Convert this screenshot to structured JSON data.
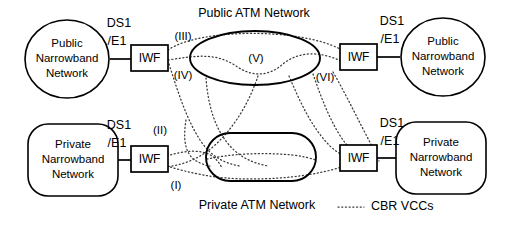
{
  "diagram": {
    "title_public_atm": "Public ATM Network",
    "title_private_atm": "Private ATM Network",
    "nodes": {
      "public_nb_left": {
        "line1": "Public",
        "line2": "Narrowband",
        "line3": "Network"
      },
      "public_nb_right": {
        "line1": "Public",
        "line2": "Narrowband",
        "line3": "Network"
      },
      "private_nb_left": {
        "line1": "Private",
        "line2": "Narrowband",
        "line3": "Network"
      },
      "private_nb_right": {
        "line1": "Private",
        "line2": "Narrowband",
        "line3": "Network"
      }
    },
    "iwf": {
      "top_left": "IWF",
      "top_right": "IWF",
      "bottom_left": "IWF",
      "bottom_right": "IWF"
    },
    "ds1_labels": {
      "top_left_line1": "DS1",
      "top_left_line2": "/E1",
      "top_right_line1": "DS1",
      "top_right_line2": "/E1",
      "bottom_left_line1": "DS1",
      "bottom_left_line2": "/E1",
      "bottom_right_line1": "DS1",
      "bottom_right_line2": "/E1"
    },
    "vcc_labels": {
      "i": "(I)",
      "ii": "(II)",
      "iii": "(III)",
      "iv": "(IV)",
      "v": "(V)",
      "vi": "(VI)"
    },
    "legend": {
      "label": "CBR VCCs"
    },
    "colors": {
      "stroke": "#000000",
      "vcc": "#3a3a3a",
      "background": "#ffffff"
    }
  }
}
